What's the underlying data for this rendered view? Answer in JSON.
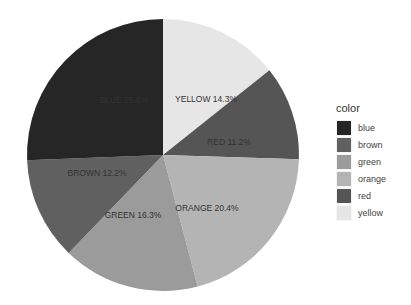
{
  "chart_data": {
    "type": "pie",
    "title": "",
    "start_angle": "12 o'clock",
    "direction": "clockwise",
    "slices": [
      {
        "name": "yellow",
        "label": "YELLOW 14.3%",
        "value": 14.3,
        "color": "#e6e6e6",
        "label_pos": [
          206,
          100
        ]
      },
      {
        "name": "red",
        "label": "RED 11.2%",
        "value": 11.2,
        "color": "#555555",
        "label_pos": [
          229,
          143
        ]
      },
      {
        "name": "orange",
        "label": "ORANGE 20.4%",
        "value": 20.4,
        "color": "#b4b4b4",
        "label_pos": [
          207,
          209
        ]
      },
      {
        "name": "green",
        "label": "GREEN 16.3%",
        "value": 16.3,
        "color": "#9b9b9b",
        "label_pos": [
          133,
          216
        ]
      },
      {
        "name": "brown",
        "label": "BROWN 12.2%",
        "value": 12.2,
        "color": "#606060",
        "label_pos": [
          97,
          174
        ]
      },
      {
        "name": "blue",
        "label": "BLUE 25.6%",
        "value": 25.6,
        "color": "#262626",
        "label_pos": [
          124,
          101
        ]
      }
    ],
    "legend": {
      "title": "color",
      "position": "right",
      "entries": [
        "blue",
        "brown",
        "green",
        "orange",
        "red",
        "yellow"
      ]
    }
  },
  "legend": {
    "title": "color",
    "items": [
      {
        "label": "blue",
        "color": "#262626"
      },
      {
        "label": "brown",
        "color": "#606060"
      },
      {
        "label": "green",
        "color": "#9b9b9b"
      },
      {
        "label": "orange",
        "color": "#b4b4b4"
      },
      {
        "label": "red",
        "color": "#555555"
      },
      {
        "label": "yellow",
        "color": "#e6e6e6"
      }
    ]
  },
  "geometry": {
    "cx": 163,
    "cy": 155,
    "r": 136
  }
}
